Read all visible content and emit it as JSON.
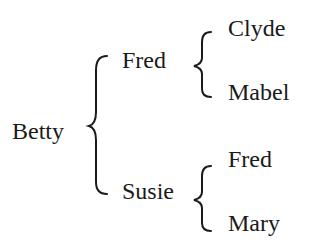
{
  "diagram": {
    "type": "family-tree-braces",
    "root": {
      "name": "Betty",
      "children": [
        {
          "name": "Fred",
          "children": [
            {
              "name": "Clyde"
            },
            {
              "name": "Mabel"
            }
          ]
        },
        {
          "name": "Susie",
          "children": [
            {
              "name": "Fred"
            },
            {
              "name": "Mary"
            }
          ]
        }
      ]
    },
    "colors": {
      "text": "#1a1a1a",
      "background": "#ffffff"
    }
  }
}
